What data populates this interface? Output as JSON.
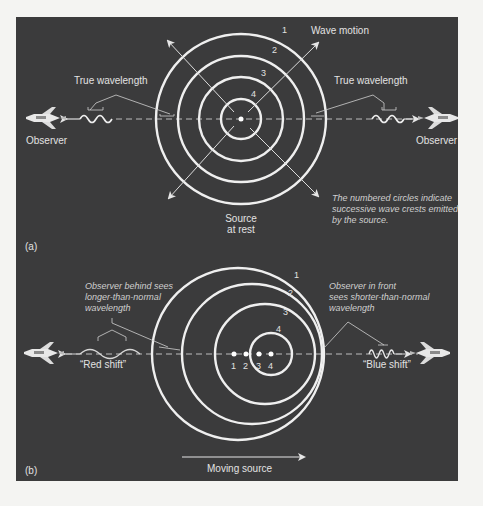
{
  "panel_a": {
    "tag": "(a)",
    "wave_motion_label": "Wave motion",
    "true_wavelength_left": "True wavelength",
    "true_wavelength_right": "True wavelength",
    "observer_left": "Observer",
    "observer_right": "Observer",
    "source_label_line1": "Source",
    "source_label_line2": "at rest",
    "note_line1": "The numbered circles indicate",
    "note_line2": "successive wave crests emitted",
    "note_line3": "by the source.",
    "circle_numbers": [
      "1",
      "2",
      "3",
      "4"
    ]
  },
  "panel_b": {
    "tag": "(b)",
    "behind_line1": "Observer behind sees",
    "behind_line2": "longer-than-normal",
    "behind_line3": "wavelength",
    "front_line1": "Observer  in front",
    "front_line2": "sees shorter-than-normal",
    "front_line3": "wavelength",
    "red_shift": "“Red shift”",
    "blue_shift": "“Blue shift”",
    "moving_source": "Moving source",
    "circle_numbers": [
      "1",
      "2",
      "3",
      "4"
    ],
    "source_positions": [
      "1",
      "2",
      "3",
      "4"
    ]
  },
  "colors": {
    "panel_bg": "#3b3b3c",
    "page_bg": "#f4f4f2",
    "ring": "#ececec",
    "text": "#e2e2e2"
  }
}
